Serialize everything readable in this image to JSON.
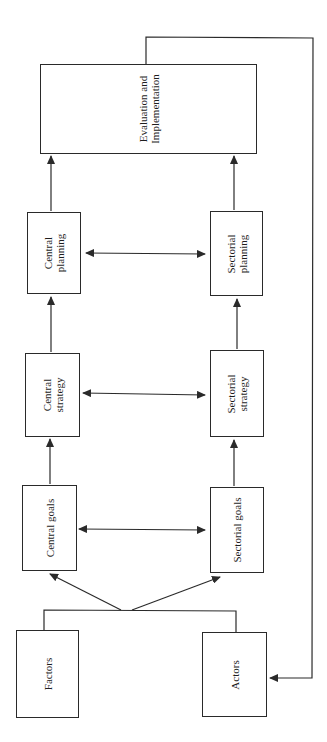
{
  "diagram": {
    "type": "flowchart",
    "orientation": "rotated-90",
    "line_color": "#2a2a2a",
    "nodes": {
      "evaluation": {
        "line1": "Evaluation and",
        "line2": "Implementation"
      },
      "central_planning": {
        "line1": "Central",
        "line2": "planning"
      },
      "sectorial_planning": {
        "line1": "Sectorial",
        "line2": "planning"
      },
      "central_strategy": {
        "line1": "Central",
        "line2": "strategy"
      },
      "sectorial_strategy": {
        "line1": "Sectorial",
        "line2": "strategy"
      },
      "central_goals": {
        "label": "Central goals"
      },
      "sectorial_goals": {
        "label": "Sectorial goals"
      },
      "factors": {
        "label": "Factors"
      },
      "actors": {
        "label": "Actors"
      }
    },
    "edges": [
      {
        "from": "factors+actors",
        "to": "central_goals",
        "type": "arrow"
      },
      {
        "from": "factors+actors",
        "to": "sectorial_goals",
        "type": "arrow"
      },
      {
        "from": "central_goals",
        "to": "sectorial_goals",
        "type": "bidirectional"
      },
      {
        "from": "central_goals",
        "to": "central_strategy",
        "type": "arrow"
      },
      {
        "from": "sectorial_goals",
        "to": "sectorial_strategy",
        "type": "arrow"
      },
      {
        "from": "central_strategy",
        "to": "sectorial_strategy",
        "type": "bidirectional"
      },
      {
        "from": "central_strategy",
        "to": "central_planning",
        "type": "arrow"
      },
      {
        "from": "sectorial_strategy",
        "to": "sectorial_planning",
        "type": "arrow"
      },
      {
        "from": "central_planning",
        "to": "sectorial_planning",
        "type": "bidirectional"
      },
      {
        "from": "central_planning",
        "to": "evaluation",
        "type": "arrow"
      },
      {
        "from": "sectorial_planning",
        "to": "evaluation",
        "type": "arrow"
      },
      {
        "from": "evaluation",
        "to": "actors",
        "type": "feedback-arrow"
      }
    ]
  }
}
